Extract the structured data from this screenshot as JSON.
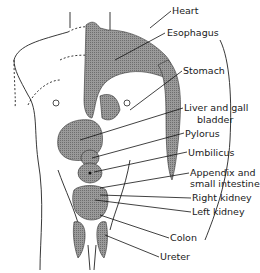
{
  "figure": {
    "type": "anatomical referred-pain map (anterior torso)",
    "shade_color": "#8a8a8a",
    "line_color": "#222222",
    "labels": [
      {
        "id": "heart",
        "text": "Heart",
        "x": 172,
        "y": 6
      },
      {
        "id": "esophagus",
        "text": "Esophagus",
        "x": 167,
        "y": 28
      },
      {
        "id": "stomach",
        "text": "Stomach",
        "x": 183,
        "y": 66
      },
      {
        "id": "liver",
        "text": "Liver and gall",
        "x": 184,
        "y": 103
      },
      {
        "id": "liver2",
        "text": "bladder",
        "x": 197,
        "y": 115
      },
      {
        "id": "pylorus",
        "text": "Pylorus",
        "x": 185,
        "y": 129
      },
      {
        "id": "umbilicus",
        "text": "Umbilicus",
        "x": 188,
        "y": 148
      },
      {
        "id": "appendix",
        "text": "Appendix and",
        "x": 190,
        "y": 168
      },
      {
        "id": "appendix2",
        "text": "small intestine",
        "x": 190,
        "y": 179
      },
      {
        "id": "right_kidney",
        "text": "Right kidney",
        "x": 192,
        "y": 193
      },
      {
        "id": "left_kidney",
        "text": "Left kidney",
        "x": 192,
        "y": 207
      },
      {
        "id": "colon",
        "text": "Colon",
        "x": 170,
        "y": 233
      },
      {
        "id": "ureter",
        "text": "Ureter",
        "x": 160,
        "y": 252
      }
    ]
  }
}
